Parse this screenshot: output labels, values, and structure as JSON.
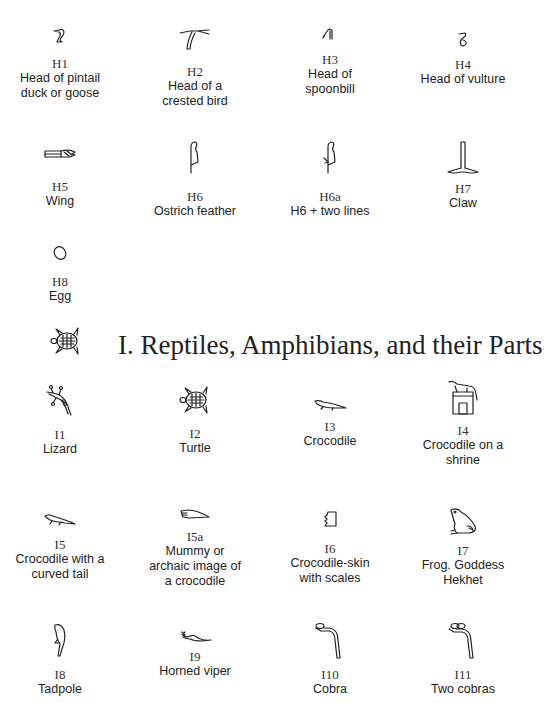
{
  "section_h": {
    "items": [
      {
        "code": "H1",
        "desc_lines": [
          "Head of pintail",
          "duck or goose"
        ],
        "icon": "duck-head-icon"
      },
      {
        "code": "H2",
        "desc_lines": [
          "Head of a",
          "crested bird"
        ],
        "icon": "crested-bird-head-icon"
      },
      {
        "code": "H3",
        "desc_lines": [
          "Head of",
          "spoonbill"
        ],
        "icon": "spoonbill-head-icon"
      },
      {
        "code": "H4",
        "desc_lines": [
          "Head of vulture"
        ],
        "icon": "vulture-head-icon"
      },
      {
        "code": "H5",
        "desc_lines": [
          "Wing"
        ],
        "icon": "wing-icon"
      },
      {
        "code": "H6",
        "desc_lines": [
          "Ostrich feather"
        ],
        "icon": "ostrich-feather-icon"
      },
      {
        "code": "H6a",
        "desc_lines": [
          "H6 + two lines"
        ],
        "icon": "feather-two-lines-icon"
      },
      {
        "code": "H7",
        "desc_lines": [
          "Claw"
        ],
        "icon": "claw-icon"
      },
      {
        "code": "H8",
        "desc_lines": [
          "Egg"
        ],
        "icon": "egg-icon"
      }
    ]
  },
  "section_i": {
    "title": "I. Reptiles, Amphibians, and their Parts",
    "title_icon": "turtle-icon",
    "items": [
      {
        "code": "I1",
        "desc_lines": [
          "Lizard"
        ],
        "icon": "lizard-icon"
      },
      {
        "code": "I2",
        "desc_lines": [
          "Turtle"
        ],
        "icon": "turtle-icon"
      },
      {
        "code": "I3",
        "desc_lines": [
          "Crocodile"
        ],
        "icon": "crocodile-icon"
      },
      {
        "code": "I4",
        "desc_lines": [
          "Crocodile on a",
          "shrine"
        ],
        "icon": "crocodile-shrine-icon"
      },
      {
        "code": "I5",
        "desc_lines": [
          "Crocodile with a",
          "curved tail"
        ],
        "icon": "crocodile-curved-tail-icon"
      },
      {
        "code": "I5a",
        "desc_lines": [
          "Mummy or",
          "archaic image of",
          "a crocodile"
        ],
        "icon": "mummy-crocodile-icon"
      },
      {
        "code": "I6",
        "desc_lines": [
          "Crocodile-skin",
          "with scales"
        ],
        "icon": "crocodile-skin-icon"
      },
      {
        "code": "I7",
        "desc_lines": [
          "Frog. Goddess",
          "Hekhet"
        ],
        "icon": "frog-icon"
      },
      {
        "code": "I8",
        "desc_lines": [
          "Tadpole"
        ],
        "icon": "tadpole-icon"
      },
      {
        "code": "I9",
        "desc_lines": [
          "Horned viper"
        ],
        "icon": "horned-viper-icon"
      },
      {
        "code": "I10",
        "desc_lines": [
          "Cobra"
        ],
        "icon": "cobra-icon"
      },
      {
        "code": "I11",
        "desc_lines": [
          "Two cobras"
        ],
        "icon": "two-cobras-icon"
      }
    ]
  }
}
